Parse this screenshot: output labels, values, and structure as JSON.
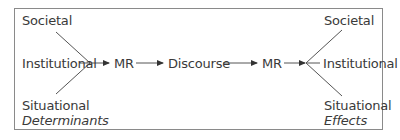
{
  "diagram": {
    "left": {
      "top": "Societal",
      "middle": "Institutional",
      "bottom": "Situational",
      "caption": "Determinants"
    },
    "flow": [
      "MR",
      "Discourse",
      "MR"
    ],
    "right": {
      "top": "Societal",
      "middle": "Institutional",
      "bottom": "Situational",
      "caption": "Effects"
    },
    "colors": {
      "line": "#555555",
      "text": "#3a3a3a",
      "border": "#8a8a8a"
    }
  }
}
